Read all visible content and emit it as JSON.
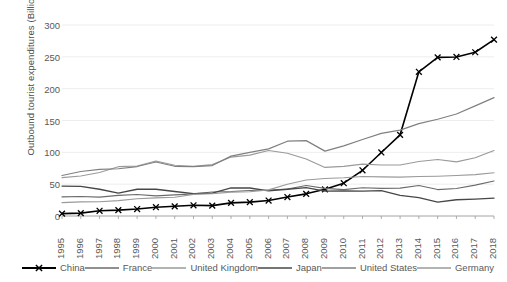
{
  "chart_data": {
    "type": "line",
    "title": "",
    "xlabel": "",
    "ylabel": "Outbound tourist  expenditures (Billion, current USD)",
    "ylim": [
      0,
      300
    ],
    "yticks": [
      0,
      50,
      100,
      150,
      200,
      250,
      300
    ],
    "grid": true,
    "legend_position": "bottom",
    "categories": [
      "1995",
      "1996",
      "1997",
      "1998",
      "1999",
      "2000",
      "2001",
      "2002",
      "2003",
      "2004",
      "2005",
      "2006",
      "2007",
      "2008",
      "2009",
      "2010",
      "2011",
      "2012",
      "2013",
      "2014",
      "2015",
      "2016",
      "2017",
      "2018"
    ],
    "series": [
      {
        "name": "China",
        "color": "#000000",
        "marker": "x",
        "width": 1.6,
        "values": [
          3.7,
          4.5,
          8.2,
          9.2,
          10.9,
          13.8,
          15.2,
          16.8,
          16.3,
          20.6,
          21.8,
          24.3,
          29.8,
          34.8,
          41.9,
          51.5,
          71.8,
          99.8,
          127.5,
          226.5,
          249.2,
          249.8,
          257.2,
          277.0
        ]
      },
      {
        "name": "France",
        "color": "#6b6b6b",
        "marker": "none",
        "width": 1.1,
        "values": [
          30.0,
          30.6,
          29.6,
          32.4,
          33.8,
          31.6,
          33.2,
          34.8,
          37.6,
          38.5,
          40.1,
          40.9,
          42.4,
          48.0,
          43.4,
          41.4,
          44.3,
          43.4,
          43.8,
          47.8,
          41.5,
          43.2,
          48.5,
          55.0
        ]
      },
      {
        "name": "United Kingdom",
        "color": "#9a9a9a",
        "marker": "none",
        "width": 1.1,
        "values": [
          60.3,
          62.9,
          68.2,
          77.5,
          78.5,
          86.4,
          79.8,
          78.0,
          80.7,
          92.5,
          95.6,
          102.9,
          98.5,
          89.6,
          76.3,
          77.9,
          81.5,
          80.2,
          80.2,
          85.5,
          88.8,
          85.0,
          91.5,
          102.9
        ]
      },
      {
        "name": "Japan",
        "color": "#474747",
        "marker": "none",
        "width": 1.3,
        "values": [
          47.0,
          46.5,
          42.0,
          36.0,
          42.0,
          42.0,
          38.5,
          35.0,
          36.0,
          44.0,
          44.0,
          39.5,
          42.0,
          44.5,
          39.0,
          39.5,
          39.0,
          39.8,
          32.5,
          29.0,
          21.8,
          25.5,
          26.5,
          28.0
        ]
      },
      {
        "name": "United States",
        "color": "#808080",
        "marker": "none",
        "width": 1.2,
        "values": [
          63.6,
          69.9,
          73.3,
          74.2,
          77.7,
          84.8,
          78.1,
          77.6,
          79.2,
          94.0,
          99.9,
          105.5,
          117.5,
          118.4,
          101.9,
          110.2,
          120.2,
          129.7,
          134.9,
          145.0,
          152.0,
          160.2,
          173.0,
          186.0
        ]
      },
      {
        "name": "Germany",
        "color": "#9a9a9a",
        "marker": "none",
        "width": 1.1,
        "values": [
          21.0,
          22.2,
          22.5,
          24.2,
          27.0,
          28.5,
          29.5,
          34.0,
          35.0,
          37.5,
          38.0,
          41.0,
          50.0,
          56.5,
          59.0,
          60.0,
          62.0,
          61.5,
          61.0,
          62.0,
          62.5,
          63.5,
          65.0,
          68.0
        ]
      }
    ]
  },
  "legend": {
    "items": [
      {
        "label": "China"
      },
      {
        "label": "France"
      },
      {
        "label": "United Kingdom"
      },
      {
        "label": "Japan"
      },
      {
        "label": "United States"
      },
      {
        "label": "Germany"
      }
    ]
  }
}
